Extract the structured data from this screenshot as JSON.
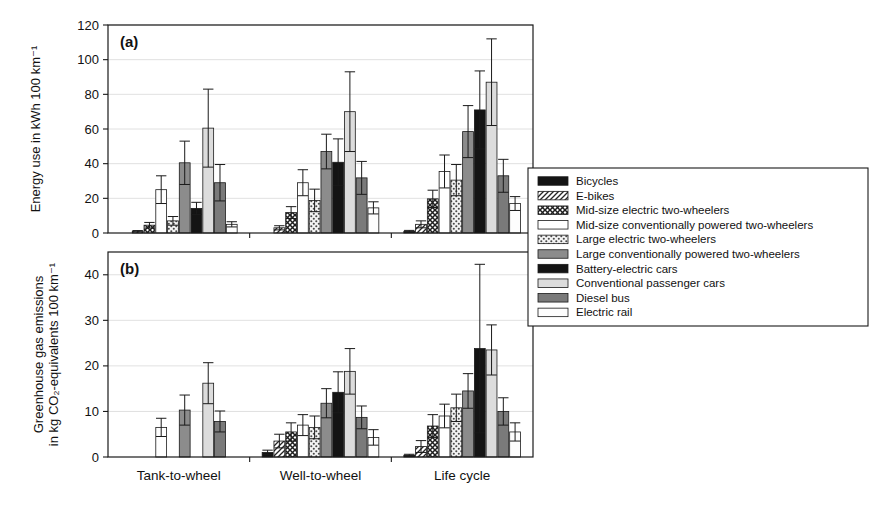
{
  "figure": {
    "width": 879,
    "height": 514,
    "background": "#ffffff"
  },
  "chart_data": [
    {
      "id": "panel-a",
      "type": "bar",
      "panel_tag": "(a)",
      "title": "",
      "xlabel": "",
      "ylabel": "Energy use in kWh 100 km⁻¹",
      "ylim": [
        0,
        120
      ],
      "yticks": [
        0,
        20,
        40,
        60,
        80,
        100,
        120
      ],
      "ytick_labels": [
        "0",
        "20",
        "40",
        "60",
        "80",
        "100",
        "120"
      ],
      "grid": true,
      "legend_position": "right-outside",
      "categories": [
        "Tank-to-wheel",
        "Well-to-wheel",
        "Life cycle"
      ],
      "series": [
        {
          "name": "Bicycles",
          "values": [
            0.0,
            0.0,
            1.0
          ],
          "errors": [
            0.0,
            0.0,
            0.5
          ]
        },
        {
          "name": "E-bikes",
          "values": [
            1.0,
            3.0,
            5.0
          ],
          "errors": [
            0.4,
            1.2,
            2.0
          ]
        },
        {
          "name": "Mid-size electric two-wheelers",
          "values": [
            4.5,
            11.8,
            19.7
          ],
          "errors": [
            1.6,
            3.4,
            5.0
          ]
        },
        {
          "name": "Mid-size conventionally powered two-wheelers",
          "values": [
            25.0,
            29.0,
            35.5
          ],
          "errors": [
            8.0,
            7.5,
            9.5
          ]
        },
        {
          "name": "Large electric two-wheelers",
          "values": [
            7.0,
            18.8,
            30.5
          ],
          "errors": [
            2.5,
            6.5,
            9.0
          ]
        },
        {
          "name": "Large conventionally powered two-wheelers",
          "values": [
            40.5,
            47.0,
            58.5
          ],
          "errors": [
            12.5,
            10.0,
            15.0
          ]
        },
        {
          "name": "Battery-electric cars",
          "values": [
            14.2,
            40.8,
            71.0
          ],
          "errors": [
            3.5,
            13.5,
            22.5
          ]
        },
        {
          "name": "Conventional passenger cars",
          "values": [
            60.5,
            70.0,
            87.0
          ],
          "errors": [
            22.5,
            23.0,
            25.0
          ]
        },
        {
          "name": "Diesel bus",
          "values": [
            29.0,
            31.8,
            33.0
          ],
          "errors": [
            10.5,
            9.5,
            9.5
          ]
        },
        {
          "name": "Electric rail",
          "values": [
            5.0,
            14.5,
            17.0
          ],
          "errors": [
            1.5,
            3.5,
            4.0
          ]
        }
      ]
    },
    {
      "id": "panel-b",
      "type": "bar",
      "panel_tag": "(b)",
      "title": "",
      "xlabel": "",
      "ylabel": "Greenhouse gas emissions in kg CO₂-equivalents 100 km⁻¹",
      "ylabel_line1": "Greenhouse gas emissions",
      "ylabel_line2": "in kg CO₂-equivalents 100 km⁻¹",
      "ylim": [
        0,
        45
      ],
      "yticks": [
        0,
        10,
        20,
        30,
        40
      ],
      "ytick_labels": [
        "0",
        "10",
        "20",
        "30",
        "40"
      ],
      "grid": true,
      "legend_position": "right-outside",
      "categories": [
        "Tank-to-wheel",
        "Well-to-wheel",
        "Life cycle"
      ],
      "series": [
        {
          "name": "Bicycles",
          "values": [
            0.0,
            1.0,
            0.4
          ],
          "errors": [
            0.0,
            0.5,
            0.2
          ]
        },
        {
          "name": "E-bikes",
          "values": [
            0.0,
            3.5,
            2.3
          ],
          "errors": [
            0.0,
            1.5,
            1.3
          ]
        },
        {
          "name": "Mid-size electric two-wheelers",
          "values": [
            0.0,
            5.5,
            6.8
          ],
          "errors": [
            0.0,
            2.0,
            2.5
          ]
        },
        {
          "name": "Mid-size conventionally powered two-wheelers",
          "values": [
            6.5,
            7.0,
            9.0
          ],
          "errors": [
            2.0,
            2.3,
            2.6
          ]
        },
        {
          "name": "Large electric two-wheelers",
          "values": [
            0.0,
            6.5,
            10.8
          ],
          "errors": [
            0.0,
            2.5,
            3.0
          ]
        },
        {
          "name": "Large conventionally powered two-wheelers",
          "values": [
            10.3,
            11.8,
            14.5
          ],
          "errors": [
            3.3,
            3.2,
            3.8
          ]
        },
        {
          "name": "Battery-electric cars",
          "values": [
            0.0,
            14.2,
            23.8
          ],
          "errors": [
            0.0,
            4.5,
            18.5
          ]
        },
        {
          "name": "Conventional passenger cars",
          "values": [
            16.2,
            18.8,
            23.5
          ],
          "errors": [
            4.5,
            5.0,
            5.5
          ]
        },
        {
          "name": "Diesel bus",
          "values": [
            7.8,
            8.7,
            10.0
          ],
          "errors": [
            2.3,
            2.5,
            3.0
          ]
        },
        {
          "name": "Electric rail",
          "values": [
            0.0,
            4.3,
            5.5
          ],
          "errors": [
            0.0,
            1.7,
            2.0
          ]
        }
      ]
    }
  ],
  "legend": {
    "title": "",
    "items": [
      {
        "label": "Bicycles",
        "pattern": "solid-black",
        "color": "#141414"
      },
      {
        "label": "E-bikes",
        "pattern": "diagonal",
        "color": "#ffffff"
      },
      {
        "label": "Mid-size electric two-wheelers",
        "pattern": "crosshatch",
        "color": "#ffffff"
      },
      {
        "label": "Mid-size conventionally powered two-wheelers",
        "pattern": "empty",
        "color": "#ffffff"
      },
      {
        "label": "Large electric two-wheelers",
        "pattern": "dots",
        "color": "#f2f2f2"
      },
      {
        "label": "Large conventionally powered two-wheelers",
        "pattern": "solid-gray",
        "color": "#8c8c8c"
      },
      {
        "label": "Battery-electric cars",
        "pattern": "solid-black",
        "color": "#141414"
      },
      {
        "label": "Conventional passenger cars",
        "pattern": "light-gray",
        "color": "#dcdcdc"
      },
      {
        "label": "Diesel bus",
        "pattern": "dark-gray",
        "color": "#7a7a7a"
      },
      {
        "label": "Electric rail",
        "pattern": "empty",
        "color": "#fdfdfd"
      }
    ]
  }
}
